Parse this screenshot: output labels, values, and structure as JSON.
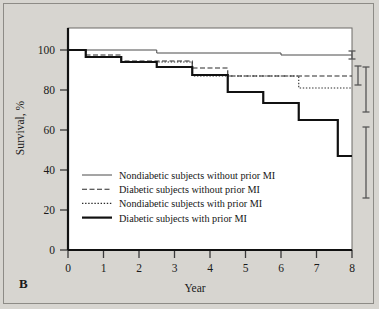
{
  "figure": {
    "panel_label": "B",
    "background_color": "#d7d5d0",
    "plot_background_color": "#ffffff",
    "border_color": "#8d8b86"
  },
  "chart_data": {
    "type": "line",
    "subtype": "kaplan-meier-step",
    "title": "",
    "xlabel": "Year",
    "ylabel": "Survival, %",
    "xlim": [
      0,
      8
    ],
    "ylim": [
      0,
      100
    ],
    "xticks": [
      0,
      1,
      2,
      3,
      4,
      5,
      6,
      7,
      8
    ],
    "xticklabels": [
      "0",
      "1",
      "2",
      "3",
      "4",
      "5",
      "6",
      "7",
      "8"
    ],
    "yticks": [
      0,
      20,
      40,
      60,
      80,
      100
    ],
    "yticklabels": [
      "0",
      "20",
      "40",
      "60",
      "80",
      "100"
    ],
    "grid": false,
    "legend_position": "lower-left-inside",
    "series": [
      {
        "name": "Nondiabetic subjects without prior MI",
        "line_style": "solid",
        "line_width": 1,
        "color": "#4a4a4a",
        "steps_x": [
          0,
          2.5,
          2.5,
          6.0,
          6.0,
          8.0
        ],
        "steps_y": [
          100,
          100,
          98.5,
          98.5,
          97.5,
          97.5
        ],
        "endpoint_value": 97.5,
        "error_bar": {
          "x": 8.0,
          "low": 95.5,
          "high": 99.5
        }
      },
      {
        "name": "Diabetic subjects without prior MI",
        "line_style": "dashed",
        "line_width": 1.1,
        "color": "#2b2b2b",
        "steps_x": [
          0,
          0.5,
          0.5,
          1.5,
          1.5,
          3.5,
          3.5,
          4.5,
          4.5,
          8.0
        ],
        "steps_y": [
          100,
          100,
          97.5,
          97.5,
          94.5,
          94.5,
          91.0,
          91.0,
          87.0,
          87.0
        ],
        "endpoint_value": 87.0,
        "error_bar": {
          "x": 8.0,
          "low": 82.5,
          "high": 92.0
        }
      },
      {
        "name": "Nondiabetic subjects with prior MI",
        "line_style": "dotted",
        "line_width": 1.1,
        "color": "#2b2b2b",
        "steps_x": [
          0,
          0.5,
          0.5,
          1.5,
          1.5,
          3.5,
          3.5,
          6.5,
          6.5,
          8.0
        ],
        "steps_y": [
          100,
          100,
          96.5,
          96.5,
          94.0,
          94.0,
          87.0,
          87.0,
          81.0,
          81.0
        ],
        "endpoint_value": 81.0,
        "error_bar": {
          "x": 8.0,
          "low": 69.0,
          "high": 91.5
        }
      },
      {
        "name": "Diabetic subjects with prior MI",
        "line_style": "solid",
        "line_width": 2.2,
        "color": "#111111",
        "steps_x": [
          0,
          0.5,
          0.5,
          1.5,
          1.5,
          2.5,
          2.5,
          3.5,
          3.5,
          4.5,
          4.5,
          5.5,
          5.5,
          6.5,
          6.5,
          7.6,
          7.6,
          8.0
        ],
        "steps_y": [
          100,
          100,
          96.5,
          96.5,
          94.0,
          94.0,
          91.5,
          91.5,
          87.5,
          87.5,
          79.0,
          79.0,
          73.5,
          73.5,
          65.0,
          65.0,
          47.0,
          47.0
        ],
        "endpoint_value": 47.0,
        "error_bar": {
          "x": 8.0,
          "low": 26.0,
          "high": 61.5
        }
      }
    ]
  },
  "legend": {
    "items": [
      {
        "label": "Nondiabetic subjects without prior MI",
        "style": "solid-thin"
      },
      {
        "label": "Diabetic subjects without prior MI",
        "style": "dashed"
      },
      {
        "label": "Nondiabetic subjects with prior MI",
        "style": "dotted"
      },
      {
        "label": "Diabetic subjects with prior MI",
        "style": "solid-thick"
      }
    ]
  }
}
